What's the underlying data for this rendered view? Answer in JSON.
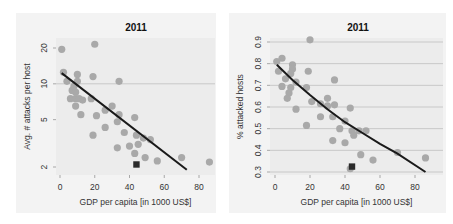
{
  "chart_data": [
    {
      "type": "scatter",
      "title": "2011",
      "xlabel": "GDP per capita [in 1000 US$]",
      "ylabel": "Avg. # attacks per host",
      "yscale": "log",
      "xlim": [
        -3,
        88
      ],
      "ylim": [
        1.75,
        23
      ],
      "xticks": [
        0,
        20,
        40,
        60,
        80
      ],
      "yticks": [
        2,
        5,
        10,
        20
      ],
      "gridlines": [
        10
      ],
      "points": [
        {
          "x": 1,
          "y": 19.5
        },
        {
          "x": 20,
          "y": 21.5
        },
        {
          "x": 2,
          "y": 12.5
        },
        {
          "x": 10,
          "y": 12
        },
        {
          "x": 19,
          "y": 11.5
        },
        {
          "x": 34,
          "y": 10.5
        },
        {
          "x": 4,
          "y": 10.5
        },
        {
          "x": 10,
          "y": 10.5
        },
        {
          "x": 8,
          "y": 9.5
        },
        {
          "x": 7,
          "y": 8.8
        },
        {
          "x": 9,
          "y": 8.5
        },
        {
          "x": 6,
          "y": 7.5
        },
        {
          "x": 9,
          "y": 7.5
        },
        {
          "x": 11,
          "y": 7.5
        },
        {
          "x": 13,
          "y": 7.3
        },
        {
          "x": 18,
          "y": 7.5
        },
        {
          "x": 9,
          "y": 6.5
        },
        {
          "x": 30,
          "y": 6.5
        },
        {
          "x": 26,
          "y": 6
        },
        {
          "x": 12,
          "y": 5.5
        },
        {
          "x": 21,
          "y": 5.4
        },
        {
          "x": 34,
          "y": 5.5
        },
        {
          "x": 43,
          "y": 5.2
        },
        {
          "x": 33,
          "y": 4.8
        },
        {
          "x": 26,
          "y": 4.3
        },
        {
          "x": 19,
          "y": 3.7
        },
        {
          "x": 37,
          "y": 3.9
        },
        {
          "x": 44,
          "y": 3.7
        },
        {
          "x": 48,
          "y": 3.5
        },
        {
          "x": 52,
          "y": 3.4
        },
        {
          "x": 45,
          "y": 3.1
        },
        {
          "x": 33,
          "y": 2.9
        },
        {
          "x": 40,
          "y": 3.0
        },
        {
          "x": 43,
          "y": 2.6
        },
        {
          "x": 49,
          "y": 2.4
        },
        {
          "x": 56,
          "y": 2.25
        },
        {
          "x": 70,
          "y": 2.4
        },
        {
          "x": 86,
          "y": 2.2
        }
      ],
      "highlight": {
        "x": 44,
        "y": 2.1,
        "marker": "square"
      },
      "fit_line": {
        "x": [
          1,
          73
        ],
        "y": [
          12.3,
          1.9
        ]
      }
    },
    {
      "type": "scatter",
      "title": "2011",
      "xlabel": "GDP per capita [in 1000 US$]",
      "ylabel": "% attacked hosts",
      "xlim": [
        -3,
        88
      ],
      "ylim": [
        0.3,
        0.9
      ],
      "xticks": [
        0,
        20,
        40,
        60,
        80
      ],
      "yticks": [
        0.3,
        0.4,
        0.5,
        0.6,
        0.7,
        0.8,
        0.9
      ],
      "gridlines": [
        0.3,
        0.4,
        0.5,
        0.6,
        0.7,
        0.8,
        0.9
      ],
      "points": [
        {
          "x": 20,
          "y": 0.91
        },
        {
          "x": 4,
          "y": 0.825
        },
        {
          "x": 1,
          "y": 0.81
        },
        {
          "x": 10,
          "y": 0.795
        },
        {
          "x": 10,
          "y": 0.775
        },
        {
          "x": 2,
          "y": 0.765
        },
        {
          "x": 19,
          "y": 0.765
        },
        {
          "x": 9,
          "y": 0.755
        },
        {
          "x": 6,
          "y": 0.73
        },
        {
          "x": 34,
          "y": 0.725
        },
        {
          "x": 12,
          "y": 0.715
        },
        {
          "x": 4,
          "y": 0.695
        },
        {
          "x": 9,
          "y": 0.69
        },
        {
          "x": 18,
          "y": 0.69
        },
        {
          "x": 8,
          "y": 0.665
        },
        {
          "x": 7,
          "y": 0.64
        },
        {
          "x": 30,
          "y": 0.64
        },
        {
          "x": 21,
          "y": 0.625
        },
        {
          "x": 26,
          "y": 0.615
        },
        {
          "x": 30,
          "y": 0.605
        },
        {
          "x": 34,
          "y": 0.61
        },
        {
          "x": 12,
          "y": 0.59
        },
        {
          "x": 43,
          "y": 0.595
        },
        {
          "x": 26,
          "y": 0.555
        },
        {
          "x": 33,
          "y": 0.555
        },
        {
          "x": 40,
          "y": 0.535
        },
        {
          "x": 18,
          "y": 0.515
        },
        {
          "x": 37,
          "y": 0.5
        },
        {
          "x": 44,
          "y": 0.49
        },
        {
          "x": 48,
          "y": 0.49
        },
        {
          "x": 52,
          "y": 0.49
        },
        {
          "x": 45,
          "y": 0.47
        },
        {
          "x": 33,
          "y": 0.445
        },
        {
          "x": 40,
          "y": 0.435
        },
        {
          "x": 49,
          "y": 0.38
        },
        {
          "x": 56,
          "y": 0.355
        },
        {
          "x": 70,
          "y": 0.39
        },
        {
          "x": 86,
          "y": 0.365
        },
        {
          "x": 43,
          "y": 0.315
        }
      ],
      "highlight": {
        "x": 44,
        "y": 0.325,
        "marker": "square"
      },
      "fit_curve": {
        "x": [
          1,
          10,
          20,
          30,
          40,
          50,
          60,
          70,
          86
        ],
        "y": [
          0.795,
          0.725,
          0.655,
          0.59,
          0.53,
          0.48,
          0.43,
          0.385,
          0.3
        ]
      }
    }
  ]
}
